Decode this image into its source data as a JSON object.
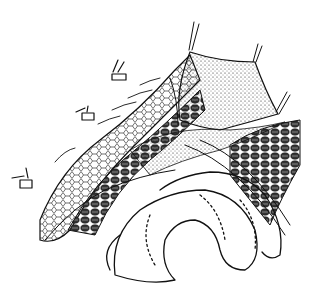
{
  "figure": {
    "type": "surgical-illustration",
    "style": "black-and-white pen-and-ink line drawing",
    "background_color": "#ffffff",
    "ink_color": "#111111",
    "elements": {
      "retracted_flap": "stippled triangular tissue flap held up by sutures at three corners",
      "abdominal_wall": "layered incision edge with cellular pattern on the left",
      "muscle_layer": "dark cross-hatched muscle tissue on the right",
      "bowel_loops": "looped intestines at the bottom with hatched outlines",
      "stay_sutures": "three small clamp-and-suture markers along the upper-left edge"
    }
  }
}
